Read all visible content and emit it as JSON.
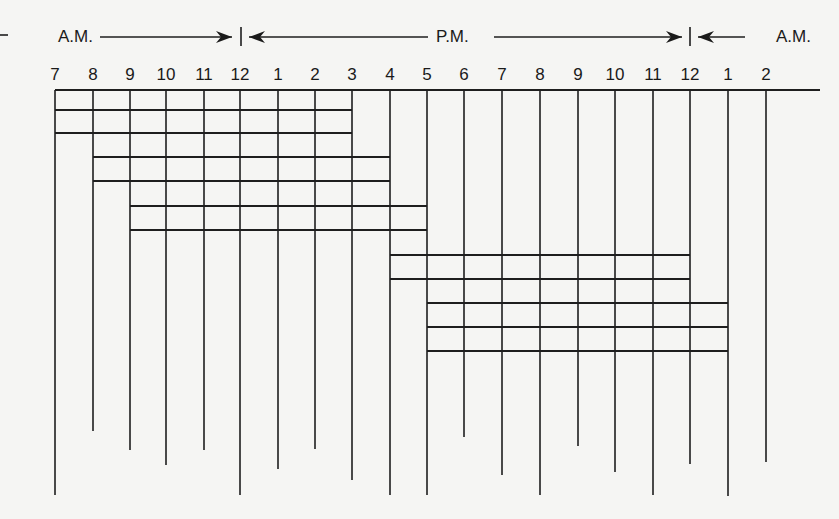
{
  "diagram": {
    "period_labels": [
      {
        "label": "A.M.",
        "x": 58,
        "y": 42
      },
      {
        "label": "P.M.",
        "x": 436,
        "y": 42
      },
      {
        "label": "A.M.",
        "x": 776,
        "y": 42
      }
    ],
    "period_arrows": [
      {
        "from": 100,
        "to": 232,
        "dir": "right"
      },
      {
        "from": 249,
        "to": 428,
        "dir": "left"
      },
      {
        "from": 494,
        "to": 682,
        "dir": "right"
      },
      {
        "from": 698,
        "to": 745,
        "dir": "left"
      }
    ],
    "period_dividers": [
      241,
      690
    ],
    "left_dash": {
      "x1": 0,
      "x2": 8,
      "y": 35
    },
    "arrow_y": 37,
    "hour_label_y": 80,
    "top_line": {
      "y": 90,
      "x1": 55,
      "x2": 820
    },
    "hours": [
      {
        "label": "7",
        "x": 55,
        "bottom": 495
      },
      {
        "label": "8",
        "x": 93,
        "bottom": 431
      },
      {
        "label": "9",
        "x": 130,
        "bottom": 450
      },
      {
        "label": "10",
        "x": 166,
        "bottom": 465
      },
      {
        "label": "11",
        "x": 204,
        "bottom": 450
      },
      {
        "label": "12",
        "x": 240,
        "bottom": 495
      },
      {
        "label": "1",
        "x": 278,
        "bottom": 469
      },
      {
        "label": "2",
        "x": 315,
        "bottom": 449
      },
      {
        "label": "3",
        "x": 352,
        "bottom": 480
      },
      {
        "label": "4",
        "x": 390,
        "bottom": 495
      },
      {
        "label": "5",
        "x": 427,
        "bottom": 495
      },
      {
        "label": "6",
        "x": 464,
        "bottom": 437
      },
      {
        "label": "7",
        "x": 502,
        "bottom": 475
      },
      {
        "label": "8",
        "x": 540,
        "bottom": 495
      },
      {
        "label": "9",
        "x": 578,
        "bottom": 446
      },
      {
        "label": "10",
        "x": 615,
        "bottom": 472
      },
      {
        "label": "11",
        "x": 653,
        "bottom": 495
      },
      {
        "label": "12",
        "x": 690,
        "bottom": 464
      },
      {
        "label": "1",
        "x": 728,
        "bottom": 496
      },
      {
        "label": "2",
        "x": 766,
        "bottom": 462
      }
    ],
    "shift_lines": [
      {
        "y": 110,
        "x1": 55,
        "x2": 352
      },
      {
        "y": 133,
        "x1": 55,
        "x2": 352
      },
      {
        "y": 157,
        "x1": 93,
        "x2": 390
      },
      {
        "y": 181,
        "x1": 93,
        "x2": 390
      },
      {
        "y": 206,
        "x1": 130,
        "x2": 427
      },
      {
        "y": 230,
        "x1": 130,
        "x2": 427
      },
      {
        "y": 255,
        "x1": 390,
        "x2": 690
      },
      {
        "y": 279,
        "x1": 390,
        "x2": 690
      },
      {
        "y": 303,
        "x1": 427,
        "x2": 728
      },
      {
        "y": 327,
        "x1": 427,
        "x2": 728
      },
      {
        "y": 351,
        "x1": 427,
        "x2": 728
      }
    ]
  }
}
